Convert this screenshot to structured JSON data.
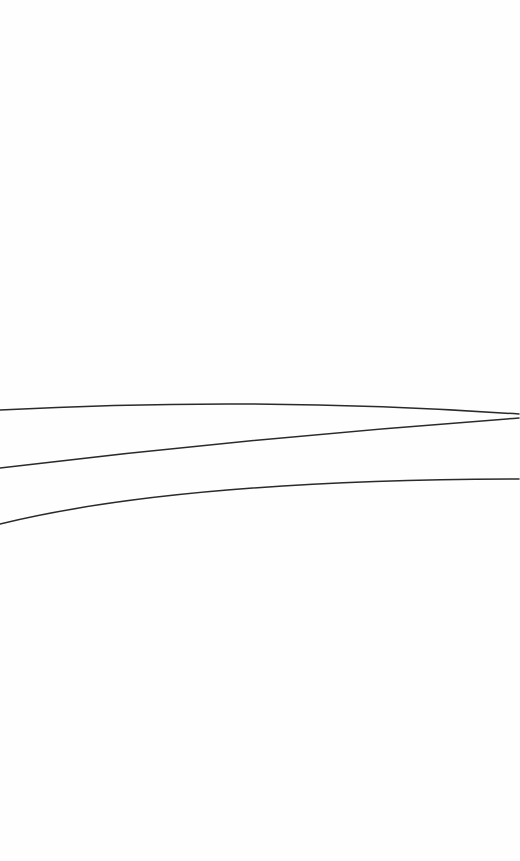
{
  "canvas": {
    "width": 520,
    "height": 861,
    "background": "#fefefe",
    "stroke_color": "#2a2a2a"
  },
  "curves": [
    {
      "name": "upper-curve",
      "path": "M 0 410 Q 260 396 519 414"
    },
    {
      "name": "middle-line",
      "path": "M 0 468 Q 260 437 519 418"
    },
    {
      "name": "lower-curve",
      "path": "M 0 524 Q 180 480 519 479"
    }
  ]
}
